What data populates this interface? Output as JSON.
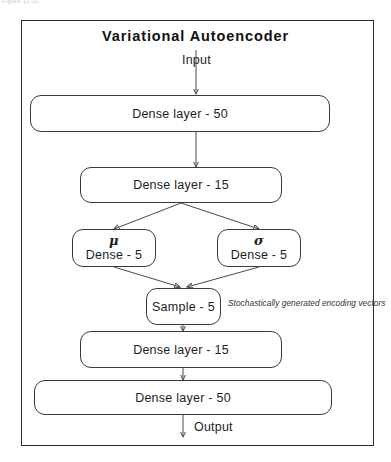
{
  "scan": {
    "caption_fragment": "Figure 11-11"
  },
  "diagram": {
    "title": "Variational Autoencoder",
    "type": "flowchart",
    "input_label": "Input",
    "output_label": "Output",
    "annotation": "Stochastically generated encoding vectors",
    "nodes": [
      {
        "id": "encoder_dense_50",
        "label": "Dense layer - 50",
        "greek": ""
      },
      {
        "id": "encoder_dense_15",
        "label": "Dense layer - 15",
        "greek": ""
      },
      {
        "id": "mu",
        "label": "Dense - 5",
        "greek": "μ"
      },
      {
        "id": "sigma",
        "label": "Dense - 5",
        "greek": "σ"
      },
      {
        "id": "sample",
        "label": "Sample - 5",
        "greek": ""
      },
      {
        "id": "decoder_dense_15",
        "label": "Dense layer - 15",
        "greek": ""
      },
      {
        "id": "decoder_dense_50",
        "label": "Dense layer - 50",
        "greek": ""
      }
    ],
    "colors": {
      "frame_border": "#2b2b2b",
      "node_border": "#3a3a3a",
      "wire": "#4a4a4a",
      "text": "#1d1d1d",
      "background": "#ffffff"
    }
  }
}
